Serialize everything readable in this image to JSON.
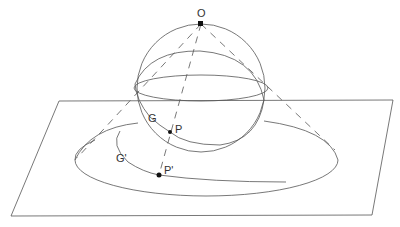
{
  "figure": {
    "labels": {
      "pole": "O",
      "circle_on_sphere": "G",
      "point_on_sphere": "P",
      "image_circle": "G'",
      "image_point": "P'"
    },
    "colors": {
      "line": "#555555",
      "point": "#111111",
      "background": "#ffffff"
    }
  }
}
